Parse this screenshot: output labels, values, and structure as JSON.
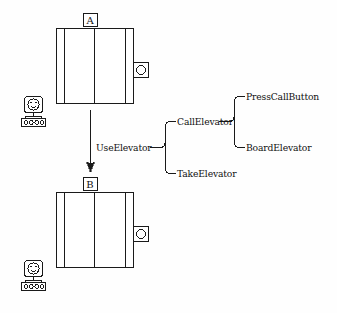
{
  "diagram": {
    "stroke_color": "#1a1a1a",
    "background_color": "#fefefe"
  },
  "scene": {
    "top_floor": {
      "label": "A",
      "elevator_name": "elevator-car-top",
      "call_button_name": "call-button-top",
      "call_button_glyph": "circle",
      "robot_name": "robot-top"
    },
    "bottom_floor": {
      "label": "B",
      "elevator_name": "elevator-car-bottom",
      "call_button_name": "call-button-bottom",
      "call_button_glyph": "circle",
      "robot_name": "robot-bottom"
    },
    "transition_arrow": "downward-arrow"
  },
  "tree": {
    "root": "UseElevator",
    "children": [
      {
        "label": "CallElevator",
        "children": [
          {
            "label": "PressCallButton"
          },
          {
            "label": "BoardElevator"
          }
        ]
      },
      {
        "label": "TakeElevator",
        "children": []
      }
    ]
  }
}
